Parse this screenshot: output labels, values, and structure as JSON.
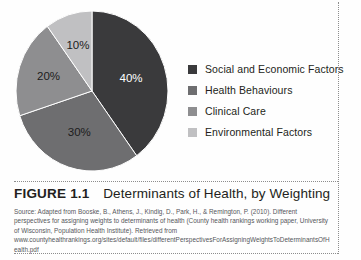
{
  "figure": {
    "number_label": "FIGURE 1.1",
    "title_text": "Determinants of Health, by Weighting",
    "source": "Source: Adapted from Booske, B., Athens, J., Kindig, D., Park, H., & Remington, P. (2010). Different perspectives for assigning weights to determinants of health (County health rankings working paper, University of Wisconsin, Population Health Institute). Retrieved from www.countyhealthrankings.org/sites/default/files/differentPerspectivesForAssigningWeightsToDeterminantsOfHealth.pdf"
  },
  "legend": {
    "items": [
      {
        "label": "Social and Economic Factors",
        "color": "#3a3a3c"
      },
      {
        "label": "Health Behaviours",
        "color": "#6e6e70"
      },
      {
        "label": "Clinical Care",
        "color": "#8e8e90"
      },
      {
        "label": "Environmental Factors",
        "color": "#c0c0c2"
      }
    ]
  },
  "chart_data": {
    "type": "pie",
    "title": "Determinants of Health, by Weighting",
    "categories": [
      "Social and Economic Factors",
      "Health Behaviours",
      "Clinical Care",
      "Environmental Factors"
    ],
    "values": [
      40,
      30,
      20,
      10
    ],
    "value_labels": [
      "40%",
      "30%",
      "20%",
      "10%"
    ],
    "colors": [
      "#3a3a3c",
      "#6e6e70",
      "#8e8e90",
      "#c0c0c2"
    ],
    "label_colors": [
      "#ffffff",
      "#1c1c1c",
      "#1c1c1c",
      "#1c1c1c"
    ],
    "start_angle_deg": 0,
    "direction": "clockwise",
    "legend_position": "right",
    "grid": false,
    "xlabel": "",
    "ylabel": ""
  }
}
